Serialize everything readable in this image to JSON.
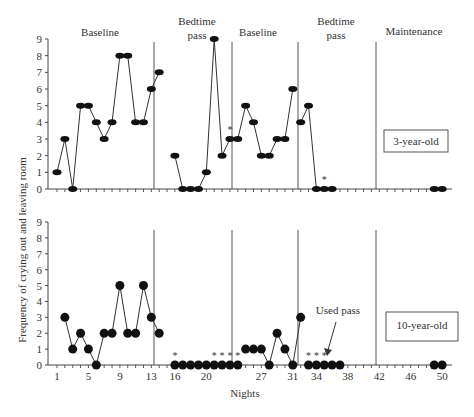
{
  "chart_data": [
    {
      "type": "line",
      "title": "3-year-old",
      "panel_label": "3-year-old",
      "xlabel": "Nights",
      "ylabel": "Frequency of crying out and leaving room",
      "ylim": [
        0,
        9
      ],
      "yticks": [
        0,
        1,
        2,
        3,
        4,
        5,
        6,
        7,
        8,
        9
      ],
      "phases": [
        {
          "label": "Baseline",
          "nights": [
            1,
            14
          ],
          "x": [
            1,
            2,
            3,
            4,
            5,
            6,
            7,
            8,
            9,
            10,
            11,
            12,
            13,
            14
          ],
          "values": [
            1,
            3,
            0,
            5,
            5,
            4,
            3,
            4,
            8,
            8,
            4,
            4,
            6,
            7,
            8
          ]
        },
        {
          "label": "Bedtime pass",
          "nights": [
            16,
            22
          ],
          "x": [
            16,
            17,
            18,
            19,
            20,
            21,
            22,
            23
          ],
          "values": [
            2,
            0,
            0,
            0,
            1,
            9,
            2,
            3
          ]
        },
        {
          "label": "Baseline",
          "nights": [
            24,
            31
          ],
          "x": [
            24,
            25,
            26,
            27,
            28,
            29,
            30,
            31
          ],
          "values": [
            3,
            5,
            4,
            2,
            2,
            3,
            3,
            6
          ]
        },
        {
          "label": "Bedtime pass",
          "nights": [
            32,
            36
          ],
          "x": [
            32,
            33,
            34,
            35,
            36
          ],
          "values": [
            4,
            5,
            0,
            0,
            0
          ]
        },
        {
          "label": "Maintenance",
          "nights": [
            49,
            50
          ],
          "x": [
            49,
            50
          ],
          "values": [
            0,
            0
          ]
        }
      ],
      "asterisks_at_nights": [
        23,
        35
      ],
      "grid": false
    },
    {
      "type": "line",
      "title": "10-year-old",
      "panel_label": "10-year-old",
      "xlabel": "Nights",
      "ylabel": "Frequency of crying out and leaving room",
      "ylim": [
        0,
        9
      ],
      "yticks": [
        0,
        1,
        2,
        3,
        4,
        5,
        6,
        7,
        8,
        9
      ],
      "xticks": [
        1,
        5,
        9,
        13,
        16,
        20,
        27,
        31,
        34,
        38,
        42,
        46,
        50
      ],
      "phases": [
        {
          "label": "Baseline",
          "x": [
            2,
            3,
            4,
            5,
            6,
            7,
            8,
            9,
            10,
            11,
            12,
            13,
            14
          ],
          "values": [
            3,
            1,
            2,
            1,
            0,
            2,
            2,
            5,
            2,
            2,
            5,
            3,
            2
          ]
        },
        {
          "label": "Bedtime pass",
          "x": [
            16,
            17,
            18,
            19,
            20,
            21,
            22,
            23,
            24
          ],
          "values": [
            0,
            0,
            0,
            0,
            0,
            0,
            0,
            0,
            0
          ]
        },
        {
          "label": "Baseline",
          "x": [
            25,
            26,
            27,
            28,
            29,
            30,
            31,
            32
          ],
          "values": [
            1,
            1,
            1,
            0,
            2,
            1,
            0,
            3
          ]
        },
        {
          "label": "Bedtime pass",
          "x": [
            33,
            34,
            35,
            36,
            37
          ],
          "values": [
            0,
            0,
            0,
            0,
            0
          ]
        },
        {
          "label": "Maintenance",
          "x": [
            49,
            50
          ],
          "values": [
            0,
            0
          ]
        }
      ],
      "asterisks_at_nights": [
        16,
        21,
        22,
        23,
        24,
        33,
        34,
        35
      ],
      "annotations": [
        "Used pass"
      ],
      "grid": false
    }
  ],
  "labels": {
    "phase_baseline": "Baseline",
    "phase_bedtime_1": "Bedtime",
    "phase_bedtime_2": "pass",
    "phase_maintenance": "Maintenance",
    "ylabel": "Frequency of crying out and leaving room",
    "xlabel": "Nights",
    "panel_top": "3-year-old",
    "panel_bottom": "10-year-old",
    "used_pass": "Used pass",
    "yticks": [
      "0",
      "1",
      "2",
      "3",
      "4",
      "5",
      "6",
      "7",
      "8",
      "9"
    ],
    "xticks": [
      "1",
      "5",
      "9",
      "13",
      "16",
      "20",
      "27",
      "31",
      "34",
      "38",
      "42",
      "46",
      "50"
    ]
  }
}
